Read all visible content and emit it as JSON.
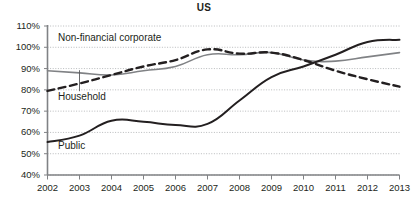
{
  "chart_data": {
    "type": "line",
    "title": "US",
    "xlabel": "",
    "ylabel": "",
    "x": [
      2002,
      2003,
      2004,
      2005,
      2006,
      2007,
      2008,
      2009,
      2010,
      2011,
      2012,
      2013
    ],
    "xtick_labels": [
      "2002",
      "2003",
      "2004",
      "2005",
      "2006",
      "2007",
      "2008",
      "2009",
      "2010",
      "2011",
      "2012",
      "2013"
    ],
    "ytick_labels": [
      "110%",
      "100%",
      "90%",
      "80%",
      "70%",
      "60%",
      "50%",
      "40%"
    ],
    "yticks": [
      110,
      100,
      90,
      80,
      70,
      60,
      50,
      40
    ],
    "ylim": [
      40,
      110
    ],
    "xlim": [
      2002,
      2013
    ],
    "y_unit": "%",
    "grid": "horizontal-dotted",
    "legend": "inline-labels",
    "series": [
      {
        "name": "Non-financial corporate",
        "style": "solid",
        "color": "#808285",
        "width": 1.6,
        "values": [
          89.0,
          88.0,
          87.0,
          89.0,
          91.0,
          96.5,
          96.5,
          97.5,
          94.0,
          93.5,
          95.5,
          97.5
        ]
      },
      {
        "name": "Household",
        "style": "dashed",
        "color": "#231f20",
        "width": 2.4,
        "values": [
          79.5,
          83.0,
          87.0,
          91.0,
          94.0,
          99.0,
          97.0,
          97.5,
          94.0,
          89.0,
          85.0,
          81.5
        ]
      },
      {
        "name": "Public",
        "style": "solid",
        "color": "#231f20",
        "width": 2.0,
        "values": [
          55.5,
          58.5,
          65.5,
          65.0,
          63.5,
          64.0,
          75.0,
          86.0,
          91.0,
          96.5,
          102.5,
          103.5
        ]
      }
    ],
    "annotations": [
      {
        "text": "Non-financial corporate",
        "target_series": "Non-financial corporate",
        "leader": "vertical-line",
        "leader_x_year": 2003,
        "leader_y_value": 89.0
      },
      {
        "text": "Household",
        "target_series": "Household"
      },
      {
        "text": "Public",
        "target_series": "Public"
      }
    ],
    "axis_color": "#808285",
    "grid_color": "#a7a9ac",
    "text_color": "#231f20"
  }
}
